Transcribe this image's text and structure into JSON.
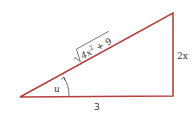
{
  "diagram": {
    "type": "right-triangle",
    "stroke_color": "#b5403f",
    "labels": {
      "hypotenuse_radicand": "4x",
      "hypotenuse_exp": "2",
      "hypotenuse_rest": " + 9",
      "opposite": "2x",
      "adjacent": "3",
      "angle": "u"
    }
  }
}
